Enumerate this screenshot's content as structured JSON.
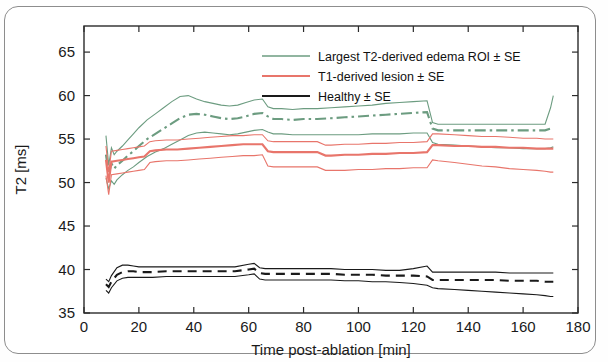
{
  "chart_data": {
    "type": "line",
    "title": "",
    "xlabel": "Time post-ablation [min]",
    "ylabel": "T2 [ms]",
    "xlim": [
      0,
      180
    ],
    "ylim": [
      35,
      68
    ],
    "xticks": [
      0,
      20,
      40,
      60,
      80,
      100,
      120,
      140,
      160,
      180
    ],
    "yticks": [
      35,
      40,
      45,
      50,
      55,
      60,
      65
    ],
    "grid": false,
    "legend_position": "top-right",
    "series": [
      {
        "name": "Largest T2-derived edema ROI ± SE",
        "color": "#6c9c80",
        "style": "dash-dot",
        "x": [
          8,
          9,
          10,
          11,
          12,
          14,
          16,
          18,
          20,
          23,
          26,
          29,
          32,
          35,
          38,
          41,
          44,
          47,
          50,
          53,
          56,
          59,
          62,
          65,
          67,
          69,
          72,
          76,
          80,
          85,
          90,
          95,
          100,
          105,
          110,
          115,
          120,
          125,
          127,
          129,
          135,
          140,
          145,
          150,
          155,
          160,
          165,
          168,
          170,
          171
        ],
        "mean": [
          53.2,
          51.0,
          52.2,
          51.6,
          52.0,
          52.5,
          53.1,
          53.6,
          54.2,
          55.0,
          55.6,
          56.2,
          56.8,
          57.4,
          57.8,
          57.9,
          57.8,
          57.6,
          57.4,
          57.3,
          57.4,
          57.6,
          57.9,
          58.0,
          57.6,
          57.3,
          57.3,
          57.2,
          57.3,
          57.3,
          57.4,
          57.5,
          57.6,
          57.7,
          57.8,
          57.9,
          58.0,
          58.1,
          56.2,
          56.0,
          56.0,
          56.0,
          56.0,
          56.0,
          56.0,
          56.0,
          56.0,
          56.0,
          56.2,
          56.3
        ],
        "upper": [
          55.4,
          52.0,
          54.0,
          53.2,
          53.6,
          54.2,
          54.9,
          55.6,
          56.3,
          57.2,
          57.9,
          58.6,
          59.3,
          59.9,
          60.0,
          59.6,
          59.3,
          59.1,
          58.9,
          58.8,
          58.9,
          59.2,
          59.5,
          59.6,
          58.7,
          58.5,
          58.5,
          58.4,
          58.5,
          58.5,
          58.6,
          58.7,
          58.8,
          58.9,
          59.1,
          59.2,
          59.3,
          59.4,
          56.9,
          56.7,
          56.7,
          56.7,
          56.7,
          56.7,
          56.7,
          56.7,
          56.7,
          56.7,
          58.6,
          60.0
        ],
        "lower": [
          50.5,
          49.3,
          50.2,
          49.8,
          50.3,
          50.9,
          51.4,
          51.8,
          52.3,
          53.0,
          53.5,
          53.9,
          54.4,
          54.9,
          55.4,
          55.7,
          55.8,
          55.7,
          55.6,
          55.5,
          55.6,
          55.8,
          56.0,
          56.1,
          55.8,
          55.6,
          55.6,
          55.5,
          55.5,
          55.5,
          55.5,
          55.5,
          55.5,
          55.6,
          55.6,
          55.6,
          55.7,
          55.7,
          54.6,
          54.4,
          54.3,
          54.2,
          54.1,
          54.0,
          54.0,
          53.9,
          53.9,
          53.9,
          54.0,
          54.1
        ]
      },
      {
        "name": "T1-derived lesion ± SE",
        "color": "#e8756b",
        "style": "solid",
        "x": [
          8,
          9,
          10,
          12,
          14,
          16,
          18,
          20,
          22,
          24,
          26,
          30,
          34,
          38,
          42,
          46,
          50,
          54,
          58,
          62,
          65,
          67,
          69,
          72,
          76,
          80,
          85,
          88,
          90,
          95,
          100,
          105,
          110,
          115,
          120,
          125,
          127,
          129,
          135,
          140,
          145,
          150,
          155,
          160,
          165,
          168,
          170,
          171
        ],
        "mean": [
          52.6,
          50.0,
          52.4,
          52.5,
          52.6,
          52.7,
          52.8,
          52.9,
          53.0,
          53.6,
          53.7,
          53.8,
          53.8,
          53.9,
          54.0,
          54.1,
          54.2,
          54.3,
          54.4,
          54.4,
          54.4,
          53.6,
          53.5,
          53.5,
          53.5,
          53.5,
          53.5,
          53.1,
          53.1,
          53.2,
          53.2,
          53.3,
          53.3,
          53.4,
          53.4,
          53.5,
          54.3,
          54.3,
          54.2,
          54.2,
          54.1,
          54.1,
          54.0,
          54.0,
          53.9,
          53.9,
          53.9,
          53.9
        ],
        "upper": [
          54.2,
          51.2,
          53.6,
          53.7,
          53.8,
          53.9,
          54.0,
          54.1,
          54.2,
          54.7,
          54.8,
          54.9,
          54.9,
          55.0,
          55.1,
          55.2,
          55.3,
          55.4,
          55.4,
          55.5,
          55.5,
          54.8,
          54.7,
          54.7,
          54.7,
          54.7,
          54.7,
          54.3,
          54.3,
          54.4,
          54.4,
          54.5,
          54.5,
          54.6,
          54.6,
          54.7,
          55.6,
          55.6,
          55.5,
          55.4,
          55.3,
          55.3,
          55.2,
          55.1,
          55.1,
          55.0,
          55.0,
          55.0
        ],
        "lower": [
          50.8,
          48.6,
          50.9,
          51.0,
          51.1,
          51.2,
          51.3,
          51.4,
          51.5,
          52.3,
          52.4,
          52.5,
          52.5,
          52.6,
          52.7,
          52.8,
          52.9,
          53.0,
          53.1,
          53.1,
          53.2,
          51.9,
          51.8,
          51.8,
          51.8,
          51.8,
          51.8,
          51.4,
          51.4,
          51.4,
          51.5,
          51.5,
          51.6,
          51.6,
          51.7,
          51.7,
          52.6,
          52.5,
          52.3,
          52.1,
          51.9,
          51.8,
          51.6,
          51.5,
          51.4,
          51.3,
          51.2,
          51.2
        ]
      },
      {
        "name": "Healthy ± SE",
        "color": "#1a1a1a",
        "style": "dashed",
        "x": [
          8,
          9,
          10,
          12,
          14,
          16,
          18,
          20,
          25,
          30,
          35,
          40,
          45,
          50,
          55,
          60,
          62,
          64,
          66,
          68,
          70,
          75,
          80,
          85,
          90,
          95,
          100,
          105,
          110,
          115,
          120,
          125,
          127,
          129,
          135,
          140,
          145,
          150,
          155,
          160,
          165,
          168,
          170,
          171
        ],
        "mean": [
          38.3,
          38.0,
          38.6,
          39.4,
          39.7,
          39.8,
          39.8,
          39.7,
          39.7,
          39.8,
          39.8,
          39.8,
          39.8,
          39.8,
          39.8,
          40.0,
          40.1,
          39.6,
          39.5,
          39.5,
          39.5,
          39.5,
          39.5,
          39.5,
          39.5,
          39.4,
          39.4,
          39.4,
          39.3,
          39.3,
          39.3,
          39.2,
          38.8,
          38.8,
          38.8,
          38.8,
          38.8,
          38.8,
          38.7,
          38.7,
          38.7,
          38.6,
          38.6,
          38.6
        ],
        "upper": [
          38.9,
          38.6,
          39.3,
          40.2,
          40.5,
          40.5,
          40.4,
          40.3,
          40.3,
          40.3,
          40.3,
          40.3,
          40.3,
          40.3,
          40.3,
          40.6,
          40.7,
          40.2,
          40.1,
          40.1,
          40.1,
          40.1,
          40.1,
          40.1,
          40.1,
          40.0,
          40.0,
          40.0,
          39.9,
          39.9,
          40.1,
          40.4,
          39.7,
          39.7,
          39.7,
          39.7,
          39.7,
          39.7,
          39.6,
          39.6,
          39.6,
          39.6,
          39.6,
          39.6
        ],
        "lower": [
          37.6,
          37.3,
          37.9,
          38.7,
          39.0,
          39.1,
          39.1,
          39.1,
          39.1,
          39.2,
          39.2,
          39.2,
          39.2,
          39.2,
          39.2,
          39.4,
          39.5,
          38.9,
          38.8,
          38.8,
          38.8,
          38.8,
          38.8,
          38.8,
          38.8,
          38.7,
          38.7,
          38.6,
          38.6,
          38.5,
          38.4,
          38.2,
          37.9,
          37.8,
          37.7,
          37.6,
          37.5,
          37.4,
          37.3,
          37.2,
          37.1,
          37.0,
          36.9,
          36.9
        ]
      }
    ]
  },
  "axes": {
    "ylabel": "T2 [ms]",
    "xlabel": "Time post-ablation [min]",
    "xticks": [
      "0",
      "20",
      "40",
      "60",
      "80",
      "100",
      "120",
      "140",
      "160",
      "180"
    ],
    "yticks": [
      "35",
      "40",
      "45",
      "50",
      "55",
      "60",
      "65"
    ]
  },
  "legend": {
    "items": [
      {
        "label": "Largest T2-derived edema ROI ± SE",
        "color": "#6c9c80",
        "style": "dash-dot"
      },
      {
        "label": "T1-derived lesion ± SE",
        "color": "#e8756b",
        "style": "solid"
      },
      {
        "label": "Healthy ± SE",
        "color": "#1a1a1a",
        "style": "solid"
      }
    ]
  }
}
